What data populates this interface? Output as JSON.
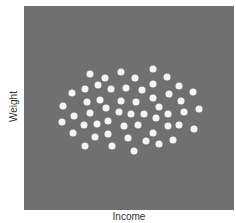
{
  "chart_data": {
    "type": "scatter",
    "title": "",
    "xlabel": "Income",
    "ylabel": "Weight",
    "grid": false,
    "legend": null,
    "xlim": [
      0,
      210
    ],
    "ylim": [
      0,
      204
    ],
    "note": "No tick labels shown; coordinates are in plot-pixel units (x from left, y from bottom).",
    "background_color": "#707070",
    "point_color": "#f4f4f4",
    "points": [
      {
        "x": 129,
        "y": 141
      },
      {
        "x": 66,
        "y": 136
      },
      {
        "x": 97,
        "y": 138
      },
      {
        "x": 81,
        "y": 132
      },
      {
        "x": 111,
        "y": 132
      },
      {
        "x": 143,
        "y": 133
      },
      {
        "x": 74,
        "y": 125
      },
      {
        "x": 129,
        "y": 126
      },
      {
        "x": 155,
        "y": 124
      },
      {
        "x": 61,
        "y": 121
      },
      {
        "x": 87,
        "y": 121
      },
      {
        "x": 102,
        "y": 122
      },
      {
        "x": 118,
        "y": 120
      },
      {
        "x": 169,
        "y": 118
      },
      {
        "x": 48,
        "y": 117
      },
      {
        "x": 145,
        "y": 116
      },
      {
        "x": 63,
        "y": 108
      },
      {
        "x": 76,
        "y": 110
      },
      {
        "x": 97,
        "y": 109
      },
      {
        "x": 112,
        "y": 108
      },
      {
        "x": 129,
        "y": 112
      },
      {
        "x": 157,
        "y": 109
      },
      {
        "x": 39,
        "y": 104
      },
      {
        "x": 82,
        "y": 102
      },
      {
        "x": 135,
        "y": 103
      },
      {
        "x": 175,
        "y": 101
      },
      {
        "x": 66,
        "y": 97
      },
      {
        "x": 95,
        "y": 98
      },
      {
        "x": 107,
        "y": 96
      },
      {
        "x": 120,
        "y": 96
      },
      {
        "x": 144,
        "y": 96
      },
      {
        "x": 160,
        "y": 98
      },
      {
        "x": 50,
        "y": 94
      },
      {
        "x": 132,
        "y": 92
      },
      {
        "x": 38,
        "y": 88
      },
      {
        "x": 84,
        "y": 89
      },
      {
        "x": 60,
        "y": 85
      },
      {
        "x": 73,
        "y": 86
      },
      {
        "x": 100,
        "y": 84
      },
      {
        "x": 114,
        "y": 85
      },
      {
        "x": 144,
        "y": 84
      },
      {
        "x": 155,
        "y": 85
      },
      {
        "x": 170,
        "y": 81
      },
      {
        "x": 49,
        "y": 77
      },
      {
        "x": 129,
        "y": 77
      },
      {
        "x": 84,
        "y": 76
      },
      {
        "x": 71,
        "y": 73
      },
      {
        "x": 104,
        "y": 72
      },
      {
        "x": 149,
        "y": 70
      },
      {
        "x": 122,
        "y": 69
      },
      {
        "x": 135,
        "y": 66
      },
      {
        "x": 61,
        "y": 64
      },
      {
        "x": 88,
        "y": 64
      },
      {
        "x": 110,
        "y": 59
      }
    ]
  }
}
